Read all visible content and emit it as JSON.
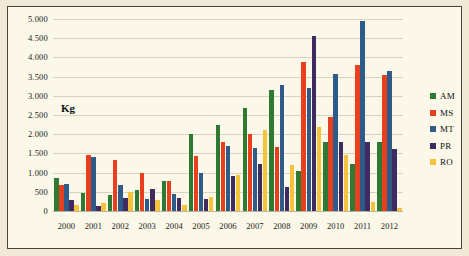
{
  "chart_data": {
    "type": "bar",
    "title": "",
    "xlabel": "",
    "ylabel": "Kg",
    "ylim": [
      0,
      5000
    ],
    "ytick_step": 500,
    "grid": true,
    "legend_position": "right",
    "categories": [
      "2000",
      "2001",
      "2002",
      "2003",
      "2004",
      "2005",
      "2006",
      "2007",
      "2008",
      "2009",
      "2010",
      "2011",
      "2012"
    ],
    "ytick_labels": [
      "5.000",
      "4.500",
      "4.000",
      "3.500",
      "3.000",
      "2.500",
      "2.000",
      "1.500",
      "1.000",
      "500",
      "0"
    ],
    "ytick_values": [
      5000,
      4500,
      4000,
      3500,
      3000,
      2500,
      2000,
      1500,
      1000,
      500,
      0
    ],
    "series": [
      {
        "name": "AM",
        "color": "#2e7a32",
        "values": [
          850,
          460,
          420,
          550,
          790,
          2000,
          2230,
          2670,
          3160,
          1050,
          1800,
          1220,
          1800
        ]
      },
      {
        "name": "MS",
        "color": "#e8401f",
        "values": [
          680,
          1450,
          1340,
          1000,
          770,
          1420,
          1800,
          2010,
          1660,
          3880,
          2450,
          3800,
          3550
        ]
      },
      {
        "name": "MT",
        "color": "#2e5c8a",
        "values": [
          700,
          1400,
          680,
          300,
          440,
          980,
          1690,
          1650,
          3270,
          3210,
          3580,
          4950,
          3650
        ]
      },
      {
        "name": "PR",
        "color": "#3f2a62",
        "values": [
          280,
          130,
          340,
          570,
          330,
          320,
          910,
          1220,
          620,
          4570,
          1800,
          1800,
          1620
        ]
      },
      {
        "name": "RO",
        "color": "#f5c33b",
        "values": [
          150,
          200,
          490,
          290,
          160,
          360,
          940,
          2100,
          1200,
          2180,
          1450,
          230,
          90
        ]
      }
    ]
  },
  "legend": {
    "items": [
      {
        "label": "AM",
        "color": "#2e7a32"
      },
      {
        "label": "MS",
        "color": "#e8401f"
      },
      {
        "label": "MT",
        "color": "#2e5c8a"
      },
      {
        "label": "PR",
        "color": "#3f2a62"
      },
      {
        "label": "RO",
        "color": "#f5c33b"
      }
    ]
  },
  "axis_title": "Kg",
  "colors": {
    "background": "#efe9d6",
    "plot_background": "#fbf8e9",
    "frame_border": "#4a4336",
    "gridline": "#d8d3bd",
    "text": "#1b1b1b"
  }
}
